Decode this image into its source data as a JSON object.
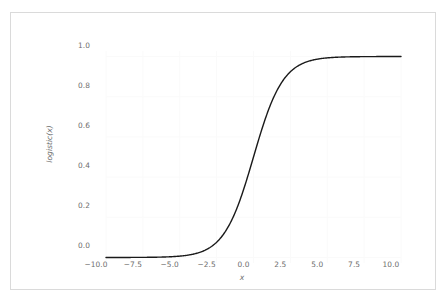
{
  "figure": {
    "background_color": "#ffffff",
    "frame_color": "#dadada",
    "grid_color": "#fafafa",
    "tick_label_color": "#6e6e6e",
    "curve_color": "#1a1a1a"
  },
  "chart_data": {
    "type": "line",
    "title": "",
    "xlabel": "x",
    "ylabel": "logistic(x)",
    "xlim": [
      -10.0,
      10.0
    ],
    "ylim": [
      -0.0275,
      1.0275
    ],
    "grid": true,
    "legend": null,
    "xticks": [
      -10.0,
      -7.5,
      -5.0,
      -2.5,
      0.0,
      2.5,
      5.0,
      7.5,
      10.0
    ],
    "xtick_labels": [
      "−10.0",
      "−7.5",
      "−5.0",
      "−2.5",
      "0.0",
      "2.5",
      "5.0",
      "7.5",
      "10.0"
    ],
    "yticks": [
      0.0,
      0.2,
      0.4,
      0.6,
      0.8,
      1.0
    ],
    "ytick_labels": [
      "0.0",
      "0.2",
      "0.4",
      "0.6",
      "0.8",
      "1.0"
    ],
    "series": [
      {
        "name": "logistic(x)",
        "color": "#1a1a1a",
        "linewidth": 1.4,
        "formula": "1 / (1 + exp(-x))",
        "x": [
          -10.0,
          -9.5,
          -9.0,
          -8.5,
          -8.0,
          -7.5,
          -7.0,
          -6.5,
          -6.0,
          -5.5,
          -5.0,
          -4.5,
          -4.0,
          -3.5,
          -3.0,
          -2.5,
          -2.0,
          -1.5,
          -1.0,
          -0.5,
          0.0,
          0.5,
          1.0,
          1.5,
          2.0,
          2.5,
          3.0,
          3.5,
          4.0,
          4.5,
          5.0,
          5.5,
          6.0,
          6.5,
          7.0,
          7.5,
          8.0,
          8.5,
          9.0,
          9.5,
          10.0
        ],
        "y": [
          4.54e-05,
          7.49e-05,
          0.0001234,
          0.0002035,
          0.0003354,
          0.0005527,
          0.0009111,
          0.0015012,
          0.0024726,
          0.0040702,
          0.0066929,
          0.0109869,
          0.0179862,
          0.0293122,
          0.0474259,
          0.0758582,
          0.1192029,
          0.1824255,
          0.2689414,
          0.3775407,
          0.5,
          0.6224593,
          0.7310586,
          0.8175745,
          0.8807971,
          0.9241418,
          0.9525741,
          0.9706877,
          0.9820138,
          0.9890131,
          0.9933071,
          0.9959298,
          0.9975274,
          0.9984988,
          0.9990889,
          0.9994473,
          0.9996646,
          0.9997965,
          0.9998766,
          0.9999251,
          0.9999546
        ]
      }
    ]
  }
}
